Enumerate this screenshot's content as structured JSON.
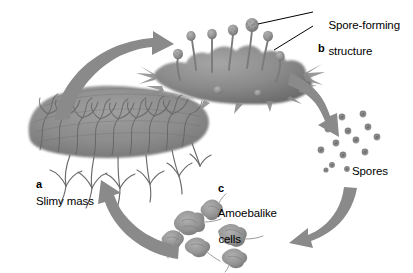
{
  "figure": {
    "background_color": "#ffffff",
    "arrow_color": "#8a8a8a",
    "organism_color": "#8d8d8d",
    "text_color": "#000000"
  },
  "labels": {
    "spore_forming_structure": "Spore-forming\nstructure",
    "spore_forming_structure_line1": "Spore-forming",
    "spore_forming_structure_line2": "structure",
    "spores": "Spores",
    "amoebalike_cells_line1": "Amoebalike",
    "amoebalike_cells_line2": "cells",
    "slimy_mass": "Slimy mass",
    "key_a": "a",
    "key_b": "b",
    "key_c": "c"
  },
  "stages": [
    {
      "key": "a",
      "name": "Slimy mass",
      "description": "Dense branching plasmodium network",
      "position": "left"
    },
    {
      "key": "b",
      "name": "Spore-forming structure",
      "description": "Mass bearing stalked sporangia",
      "position": "top",
      "sporangia_count": 7
    },
    {
      "key": "c",
      "name": "Amoebalike cells",
      "description": "Individual amoeboid cells with pseudopods",
      "position": "bottom",
      "cell_count": 6
    }
  ],
  "spores": {
    "label": "Spores",
    "count": 14,
    "dot_color": "#909090",
    "dot_core_color": "#6f6f6f"
  },
  "cycle_arrows": [
    {
      "name": "slimy-mass-to-spore-structure",
      "from": "a",
      "to": "b",
      "direction": "up-right"
    },
    {
      "name": "spore-structure-to-spores",
      "from": "b",
      "to": "spores",
      "direction": "down-right"
    },
    {
      "name": "spores-to-amoeba-cells",
      "from": "spores",
      "to": "c",
      "direction": "down-left"
    },
    {
      "name": "amoeba-cells-to-slimy-mass",
      "from": "c",
      "to": "a",
      "direction": "up-left"
    }
  ],
  "leader_lines": [
    {
      "name": "leader-to-upper-sporangium",
      "target": "upper sporangium head"
    },
    {
      "name": "leader-to-lower-sporangium",
      "target": "lower sporangium head"
    }
  ]
}
